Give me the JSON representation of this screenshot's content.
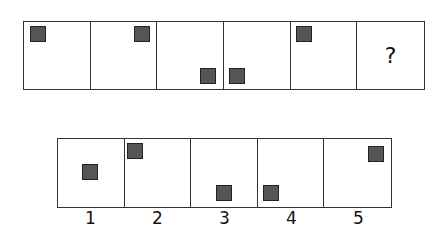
{
  "question_row": {
    "cells": [
      {
        "has_square": true,
        "square": {
          "left": 6,
          "top": 4
        }
      },
      {
        "has_square": true,
        "square": {
          "left": 43,
          "top": 4
        }
      },
      {
        "has_square": true,
        "square": {
          "left": 43,
          "top": 46
        }
      },
      {
        "has_square": true,
        "square": {
          "left": 5,
          "top": 46
        }
      },
      {
        "has_square": true,
        "square": {
          "left": 5,
          "top": 4
        }
      },
      {
        "has_square": false,
        "text": "?"
      }
    ]
  },
  "answer_row": {
    "cells": [
      {
        "label": "1",
        "square": {
          "left": 24,
          "top": 25
        }
      },
      {
        "label": "2",
        "square": {
          "left": 2,
          "top": 4
        }
      },
      {
        "label": "3",
        "square": {
          "left": 25,
          "top": 46
        }
      },
      {
        "label": "4",
        "square": {
          "left": 5,
          "top": 46
        }
      },
      {
        "label": "5",
        "square": {
          "left": 44,
          "top": 7
        }
      }
    ]
  },
  "colors": {
    "square_fill": "#555555",
    "border": "#333333"
  }
}
